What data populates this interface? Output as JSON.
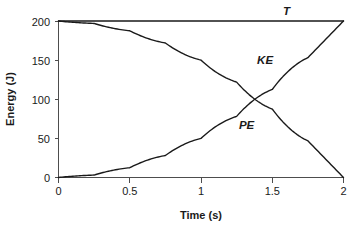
{
  "chart_data": {
    "type": "line",
    "title": "",
    "xlabel": "Time (s)",
    "ylabel": "Energy (J)",
    "xlim": [
      0,
      2
    ],
    "ylim": [
      0,
      200
    ],
    "xticks": [
      0,
      0.5,
      1,
      1.5,
      2
    ],
    "xtick_labels": [
      "0",
      "0.5",
      "1",
      "1.5",
      "2"
    ],
    "yticks": [
      0,
      50,
      100,
      150,
      200
    ],
    "ytick_labels": [
      "0",
      "50",
      "100",
      "150",
      "200"
    ],
    "grid": false,
    "legend_position": "inline-annotations",
    "series": [
      {
        "name": "T",
        "label": "T",
        "description": "Total mechanical energy, constant",
        "x": [
          0,
          0.25,
          0.5,
          0.75,
          1,
          1.25,
          1.5,
          1.75,
          2
        ],
        "values": [
          200,
          200,
          200,
          200,
          200,
          200,
          200,
          200,
          200
        ]
      },
      {
        "name": "KE",
        "label": "KE",
        "description": "Kinetic energy, rises as 50*t^2",
        "x": [
          0,
          0.25,
          0.5,
          0.75,
          1,
          1.25,
          1.5,
          1.75,
          2
        ],
        "values": [
          0,
          3.1,
          12.5,
          28.1,
          50,
          78.1,
          112.5,
          153.1,
          200
        ]
      },
      {
        "name": "PE",
        "label": "PE",
        "description": "Potential energy, falls as 200 - 50*t^2",
        "x": [
          0,
          0.25,
          0.5,
          0.75,
          1,
          1.25,
          1.5,
          1.75,
          2
        ],
        "values": [
          200,
          196.9,
          187.5,
          171.9,
          150,
          121.9,
          87.5,
          46.9,
          0
        ]
      }
    ],
    "annotations": [
      {
        "text": "T",
        "x": 1.6,
        "y": 200
      },
      {
        "text": "KE",
        "x": 1.45,
        "y": 145
      },
      {
        "text": "PE",
        "x": 1.32,
        "y": 62
      }
    ],
    "crossing_point": {
      "x": 1.41,
      "y": 100
    }
  },
  "axes": {
    "y_title": "Energy (J)",
    "x_title": "Time (s)"
  },
  "labels": {
    "total": "T",
    "kinetic": "KE",
    "potential": "PE"
  },
  "colors": {
    "curve": "#1a1a1a",
    "axis": "#4d4d4d",
    "text": "#1a1a1a",
    "background": "#ffffff"
  }
}
